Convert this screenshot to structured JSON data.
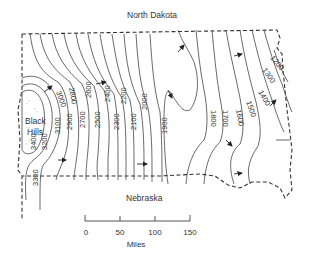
{
  "labels": {
    "north": "North Dakota",
    "south": "Nebraska",
    "feature": [
      "Black",
      "Hills"
    ]
  },
  "scale": {
    "ticks": [
      "0",
      "50",
      "100",
      "150"
    ],
    "unit": "Miles"
  },
  "contours": {
    "units": "",
    "values": [
      "3400",
      "3300",
      "3200",
      "3100",
      "3000",
      "2900",
      "2800",
      "2700",
      "2600",
      "2500",
      "2400",
      "2300",
      "2200",
      "2100",
      "2000",
      "1900",
      "1800",
      "1700",
      "1600",
      "1500",
      "1400",
      "1300",
      "1200"
    ]
  },
  "colors": {
    "line": "#333333",
    "background": "#ffffff"
  }
}
